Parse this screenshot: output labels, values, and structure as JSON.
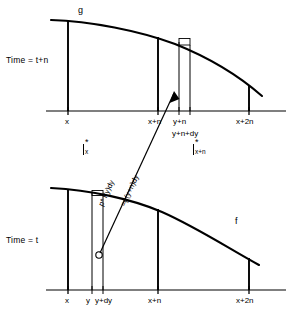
{
  "figure": {
    "title": "",
    "type": "diagram",
    "background_color": "#ffffff",
    "stroke_color": "#000000",
    "panels": [
      {
        "id": "top-panel",
        "time_label": "Time = t+n",
        "curve_label": "g",
        "axis_ticks": [
          "x",
          "x+n",
          "y+n",
          "y+n+dy",
          "x+2n"
        ]
      },
      {
        "id": "bottom-panel",
        "time_label": "Time = t",
        "curve_label": "f",
        "axis_ticks": [
          "x",
          "y",
          "y+dy",
          "x+n",
          "x+2n"
        ]
      }
    ],
    "middle": {
      "left_integral": {
        "glyph": "I",
        "superscript": "*",
        "subscript": "x"
      },
      "right_integral": {
        "glyph": "I",
        "superscript": "*",
        "subscript": "x+n"
      },
      "arrow_label_left": "p* f(y)dy",
      "arrow_label_left_sub": "n",
      "arrow_label_left_sub2": "x",
      "arrow_label_right": "=g(y+n)dy"
    }
  }
}
